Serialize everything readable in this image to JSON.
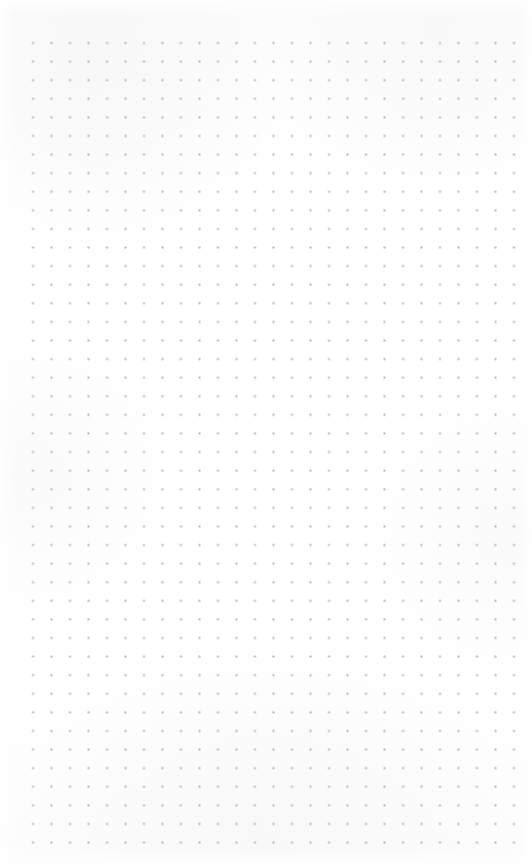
{
  "page": {
    "kind": "dot-grid-paper",
    "width": 532,
    "height": 864,
    "background_color": "#fdfdfd",
    "paper_tint": "#ffffff"
  },
  "grid": {
    "dot_color": "#b9b9bd",
    "dot_size_px": 1.5,
    "spacing_x_px": 18.5,
    "spacing_y_px": 18.6,
    "origin_x_px": 33,
    "origin_y_px": 43,
    "columns": 27,
    "rows": 44,
    "margin_left_px": 33,
    "margin_top_px": 43,
    "margin_right_px": 19,
    "margin_bottom_px": 19,
    "shape": "square"
  },
  "content": {
    "text": "",
    "annotations": []
  }
}
